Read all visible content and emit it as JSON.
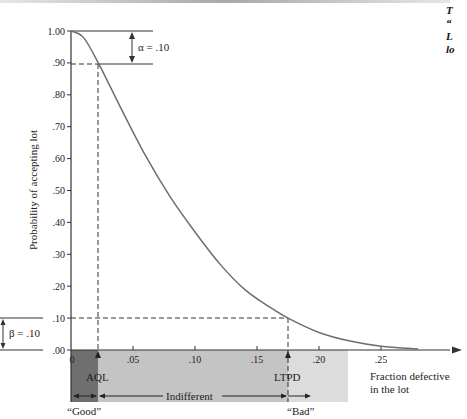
{
  "chart_data": {
    "type": "line",
    "xlabel": "Fraction defective in the lot",
    "ylabel": "Probability of accepting lot",
    "xlim": [
      0,
      0.28
    ],
    "ylim": [
      0,
      1.0
    ],
    "x_ticks": [
      "0",
      ".05",
      ".10",
      ".15",
      ".20",
      ".25"
    ],
    "y_ticks": [
      ".00",
      ".10",
      ".20",
      ".30",
      ".40",
      ".50",
      ".60",
      ".70",
      ".80",
      ".90",
      "1.00"
    ],
    "grid": false,
    "series": [
      {
        "name": "OC curve",
        "x": [
          0,
          0.01,
          0.022,
          0.04,
          0.06,
          0.08,
          0.1,
          0.12,
          0.14,
          0.16,
          0.175,
          0.2,
          0.225,
          0.25,
          0.28
        ],
        "y": [
          1.0,
          0.98,
          0.9,
          0.76,
          0.61,
          0.48,
          0.37,
          0.27,
          0.19,
          0.135,
          0.1,
          0.055,
          0.028,
          0.012,
          0.003
        ]
      }
    ],
    "annotations": {
      "alpha": "α = .10",
      "beta": "β = .10",
      "aql": {
        "label": "AQL",
        "x": 0.022
      },
      "ltpd": {
        "label": "LTPD",
        "x": 0.175
      },
      "regions": [
        "“Good”",
        "Indifferent",
        "“Bad”"
      ]
    }
  },
  "caption": "T\n“\nL\nlo",
  "colors": {
    "curve": "#6e6e6e",
    "axis": "#333333",
    "good_region": "#6f6f6f",
    "indifferent_region": "#c6c6c6",
    "bad_region": "#dedede"
  }
}
